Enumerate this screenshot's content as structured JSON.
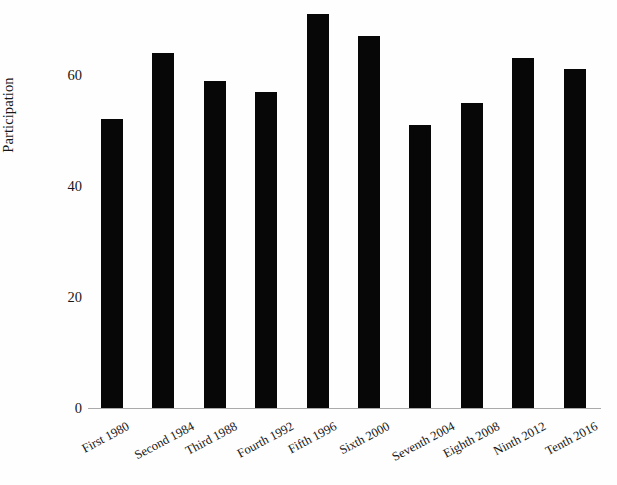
{
  "chart_data": {
    "type": "bar",
    "title": "",
    "xlabel": "",
    "ylabel": "Participation",
    "categories": [
      "First 1980",
      "Second 1984",
      "Third 1988",
      "Fourth 1992",
      "Fifth 1996",
      "Sixth 2000",
      "Seventh 2004",
      "Eighth 2008",
      "Ninth 2012",
      "Tenth 2016"
    ],
    "values": [
      52,
      64,
      59,
      57,
      71,
      67,
      51,
      55,
      63,
      61
    ],
    "ylim": [
      0,
      72
    ],
    "yticks": [
      0,
      20,
      40,
      60
    ],
    "ytick_labels": [
      "0",
      "20",
      "40",
      "60"
    ],
    "grid": false,
    "legend": null,
    "bar_color": "#070707",
    "axis_color": "#aaaaaa",
    "background_color": "#fefefe"
  }
}
